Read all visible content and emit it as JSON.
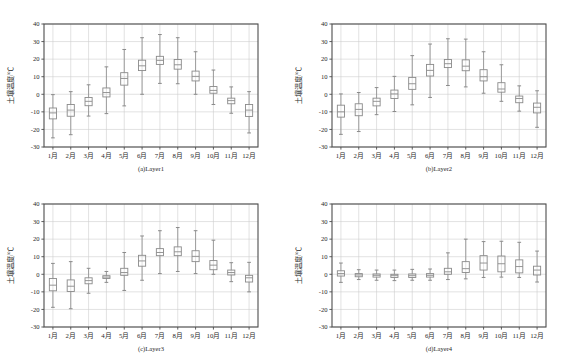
{
  "figure": {
    "width": 575,
    "height": 358,
    "background": "#ffffff",
    "axis_color": "#4d4d4d",
    "grid_color": "#cfcfcf",
    "box_color": "#8a8a8a",
    "text_color": "#2a2a2a"
  },
  "axes": {
    "ylabel": "土壤温度/℃",
    "yticks": [
      40,
      30,
      20,
      10,
      0,
      -10,
      -20,
      -30
    ],
    "ytick_labels": [
      "40",
      "30",
      "20",
      "10",
      "0",
      "-10",
      "-20",
      "-30"
    ],
    "ylim": [
      -30,
      40
    ],
    "xtick_labels": [
      "1月",
      "2月",
      "3月",
      "4月",
      "5月",
      "6月",
      "7月",
      "8月",
      "9月",
      "10月",
      "11月",
      "12月"
    ],
    "grid": true,
    "legend": "none"
  },
  "chart_data": [
    {
      "type": "boxplot",
      "id": "panel-a",
      "caption": "(a)Layer1",
      "title": "",
      "xlabel": "",
      "ylabel": "土壤温度/℃",
      "ylim": [
        -30,
        40
      ],
      "categories": [
        "1月",
        "2月",
        "3月",
        "4月",
        "5月",
        "6月",
        "7月",
        "8月",
        "9月",
        "10月",
        "11月",
        "12月"
      ],
      "boxes": [
        {
          "category": "1月",
          "whisker_low": -24.8,
          "q1": -14.0,
          "median": -10.6,
          "q3": -7.8,
          "whisker_high": -0.2
        },
        {
          "category": "2月",
          "whisker_low": -23.0,
          "q1": -12.5,
          "median": -9.0,
          "q3": -5.8,
          "whisker_high": 1.5
        },
        {
          "category": "3月",
          "whisker_low": -12.4,
          "q1": -6.5,
          "median": -4.0,
          "q3": -1.8,
          "whisker_high": 5.4
        },
        {
          "category": "4月",
          "whisker_low": -11.0,
          "q1": -1.5,
          "median": 1.0,
          "q3": 3.6,
          "whisker_high": 15.6
        },
        {
          "category": "5月",
          "whisker_low": -6.6,
          "q1": 5.2,
          "median": 9.0,
          "q3": 12.3,
          "whisker_high": 25.5
        },
        {
          "category": "6月",
          "whisker_low": 0.0,
          "q1": 13.5,
          "median": 16.2,
          "q3": 19.4,
          "whisker_high": 32.2
        },
        {
          "category": "7月",
          "whisker_low": 6.2,
          "q1": 17.0,
          "median": 19.3,
          "q3": 21.6,
          "whisker_high": 34.0
        },
        {
          "category": "8月",
          "whisker_low": 6.0,
          "q1": 14.3,
          "median": 16.8,
          "q3": 19.8,
          "whisker_high": 32.2
        },
        {
          "category": "9月",
          "whisker_low": 0.0,
          "q1": 7.6,
          "median": 10.2,
          "q3": 13.2,
          "whisker_high": 24.2
        },
        {
          "category": "10月",
          "whisker_low": -5.8,
          "q1": 0.6,
          "median": 2.2,
          "q3": 4.4,
          "whisker_high": 13.8
        },
        {
          "category": "11月",
          "whisker_low": -10.8,
          "q1": -5.4,
          "median": -3.6,
          "q3": -2.2,
          "whisker_high": 4.2
        },
        {
          "category": "12月",
          "whisker_low": -22.0,
          "q1": -12.6,
          "median": -9.0,
          "q3": -5.8,
          "whisker_high": 1.5
        }
      ]
    },
    {
      "type": "boxplot",
      "id": "panel-b",
      "caption": "(b)Layer2",
      "title": "",
      "xlabel": "",
      "ylabel": "土壤温度/℃",
      "ylim": [
        -30,
        40
      ],
      "categories": [
        "1月",
        "2月",
        "3月",
        "4月",
        "5月",
        "6月",
        "7月",
        "8月",
        "9月",
        "10月",
        "11月",
        "12月"
      ],
      "boxes": [
        {
          "category": "1月",
          "whisker_low": -22.8,
          "q1": -13.0,
          "median": -10.0,
          "q3": -6.2,
          "whisker_high": 0.2
        },
        {
          "category": "2月",
          "whisker_low": -21.2,
          "q1": -12.2,
          "median": -8.6,
          "q3": -5.4,
          "whisker_high": 1.0
        },
        {
          "category": "3月",
          "whisker_low": -11.6,
          "q1": -6.6,
          "median": -4.0,
          "q3": -2.2,
          "whisker_high": 3.8
        },
        {
          "category": "4月",
          "whisker_low": -9.8,
          "q1": -2.4,
          "median": 0.2,
          "q3": 2.4,
          "whisker_high": 10.2
        },
        {
          "category": "5月",
          "whisker_low": -6.0,
          "q1": 2.8,
          "median": 6.0,
          "q3": 9.6,
          "whisker_high": 22.0
        },
        {
          "category": "6月",
          "whisker_low": -1.8,
          "q1": 10.4,
          "median": 13.6,
          "q3": 17.0,
          "whisker_high": 28.6
        },
        {
          "category": "7月",
          "whisker_low": 5.0,
          "q1": 15.2,
          "median": 17.4,
          "q3": 19.8,
          "whisker_high": 31.6
        },
        {
          "category": "8月",
          "whisker_low": 4.2,
          "q1": 13.4,
          "median": 16.0,
          "q3": 19.6,
          "whisker_high": 31.4
        },
        {
          "category": "9月",
          "whisker_low": 0.6,
          "q1": 7.6,
          "median": 10.0,
          "q3": 14.0,
          "whisker_high": 24.2
        },
        {
          "category": "10月",
          "whisker_low": -4.0,
          "q1": 1.2,
          "median": 3.0,
          "q3": 6.6,
          "whisker_high": 16.8
        },
        {
          "category": "11月",
          "whisker_low": -9.6,
          "q1": -4.8,
          "median": -2.4,
          "q3": -1.0,
          "whisker_high": 4.8
        },
        {
          "category": "12月",
          "whisker_low": -18.8,
          "q1": -10.6,
          "median": -7.4,
          "q3": -5.0,
          "whisker_high": 2.0
        }
      ]
    },
    {
      "type": "boxplot",
      "id": "panel-c",
      "caption": "(c)Layer3",
      "title": "",
      "xlabel": "",
      "ylabel": "土壤温度/℃",
      "ylim": [
        -30,
        40
      ],
      "categories": [
        "1月",
        "2月",
        "3月",
        "4月",
        "5月",
        "6月",
        "7月",
        "8月",
        "9月",
        "10月",
        "11月",
        "12月"
      ],
      "boxes": [
        {
          "category": "1月",
          "whisker_low": -18.8,
          "q1": -9.4,
          "median": -6.2,
          "q3": -2.4,
          "whisker_high": 6.2
        },
        {
          "category": "2月",
          "whisker_low": -19.6,
          "q1": -9.8,
          "median": -6.8,
          "q3": -3.2,
          "whisker_high": 7.2
        },
        {
          "category": "3月",
          "whisker_low": -10.8,
          "q1": -5.4,
          "median": -3.6,
          "q3": -2.0,
          "whisker_high": 3.4
        },
        {
          "category": "4月",
          "whisker_low": -4.6,
          "q1": -2.4,
          "median": -1.6,
          "q3": -0.8,
          "whisker_high": 1.6
        },
        {
          "category": "5月",
          "whisker_low": -9.2,
          "q1": -0.6,
          "median": 1.0,
          "q3": 3.4,
          "whisker_high": 12.4
        },
        {
          "category": "6月",
          "whisker_low": -3.4,
          "q1": 4.6,
          "median": 7.6,
          "q3": 10.8,
          "whisker_high": 21.8
        },
        {
          "category": "7月",
          "whisker_low": 0.4,
          "q1": 10.6,
          "median": 12.4,
          "q3": 14.6,
          "whisker_high": 24.8
        },
        {
          "category": "8月",
          "whisker_low": 1.6,
          "q1": 10.6,
          "median": 12.8,
          "q3": 15.6,
          "whisker_high": 26.6
        },
        {
          "category": "9月",
          "whisker_low": 0.4,
          "q1": 7.2,
          "median": 10.2,
          "q3": 13.4,
          "whisker_high": 24.8
        },
        {
          "category": "10月",
          "whisker_low": 0.0,
          "q1": 2.6,
          "median": 5.2,
          "q3": 7.8,
          "whisker_high": 19.4
        },
        {
          "category": "11月",
          "whisker_low": -4.2,
          "q1": -0.4,
          "median": 1.0,
          "q3": 2.4,
          "whisker_high": 6.6
        },
        {
          "category": "12月",
          "whisker_low": -10.0,
          "q1": -4.4,
          "median": -2.0,
          "q3": -0.6,
          "whisker_high": 6.8
        }
      ]
    },
    {
      "type": "boxplot",
      "id": "panel-d",
      "caption": "(d)Layer4",
      "title": "",
      "xlabel": "",
      "ylabel": "土壤温度/℃",
      "ylim": [
        -30,
        40
      ],
      "categories": [
        "1月",
        "2月",
        "3月",
        "4月",
        "5月",
        "6月",
        "7月",
        "8月",
        "9月",
        "10月",
        "11月",
        "12月"
      ],
      "boxes": [
        {
          "category": "1月",
          "whisker_low": -4.6,
          "q1": -1.0,
          "median": 0.4,
          "q3": 2.0,
          "whisker_high": 6.4
        },
        {
          "category": "2月",
          "whisker_low": -3.0,
          "q1": -1.4,
          "median": -0.4,
          "q3": 0.4,
          "whisker_high": 2.6
        },
        {
          "category": "3月",
          "whisker_low": -3.4,
          "q1": -1.6,
          "median": -0.6,
          "q3": 0.2,
          "whisker_high": 2.4
        },
        {
          "category": "4月",
          "whisker_low": -3.6,
          "q1": -1.8,
          "median": -0.8,
          "q3": 0.0,
          "whisker_high": 2.4
        },
        {
          "category": "5月",
          "whisker_low": -3.4,
          "q1": -1.8,
          "median": -0.8,
          "q3": 0.2,
          "whisker_high": 2.8
        },
        {
          "category": "6月",
          "whisker_low": -3.4,
          "q1": -1.6,
          "median": -0.6,
          "q3": 0.4,
          "whisker_high": 3.0
        },
        {
          "category": "7月",
          "whisker_low": -3.0,
          "q1": 0.0,
          "median": 1.4,
          "q3": 3.4,
          "whisker_high": 12.2
        },
        {
          "category": "8月",
          "whisker_low": -2.6,
          "q1": 1.0,
          "median": 3.2,
          "q3": 7.2,
          "whisker_high": 20.0
        },
        {
          "category": "9月",
          "whisker_low": -1.8,
          "q1": 2.4,
          "median": 6.4,
          "q3": 10.6,
          "whisker_high": 18.6
        },
        {
          "category": "10月",
          "whisker_low": -1.6,
          "q1": 1.4,
          "median": 6.0,
          "q3": 10.4,
          "whisker_high": 18.8
        },
        {
          "category": "11月",
          "whisker_low": -1.8,
          "q1": 0.8,
          "median": 4.4,
          "q3": 8.2,
          "whisker_high": 18.2
        },
        {
          "category": "12月",
          "whisker_low": -4.4,
          "q1": -0.4,
          "median": 2.4,
          "q3": 4.6,
          "whisker_high": 13.2
        }
      ]
    }
  ]
}
